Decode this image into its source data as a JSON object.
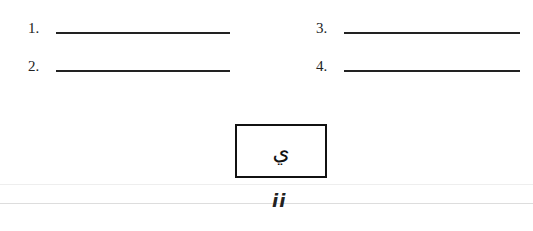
{
  "answer_lines": [
    {
      "number": "1."
    },
    {
      "number": "2."
    },
    {
      "number": "3."
    },
    {
      "number": "4."
    }
  ],
  "letter_box": {
    "glyph": "ي"
  },
  "page_number": "ii"
}
